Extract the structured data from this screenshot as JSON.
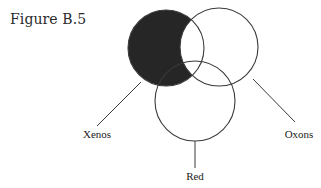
{
  "figure": {
    "title": "Figure B.5"
  },
  "diagram": {
    "type": "venn",
    "sets": [
      {
        "id": "xenos",
        "label": "Xenos"
      },
      {
        "id": "oxons",
        "label": "Oxons"
      },
      {
        "id": "red",
        "label": "Red"
      }
    ],
    "shaded_region": "Xenos only (Xenos not Oxons)",
    "shade_color": "#262626",
    "line_color": "#3a3a3a"
  }
}
